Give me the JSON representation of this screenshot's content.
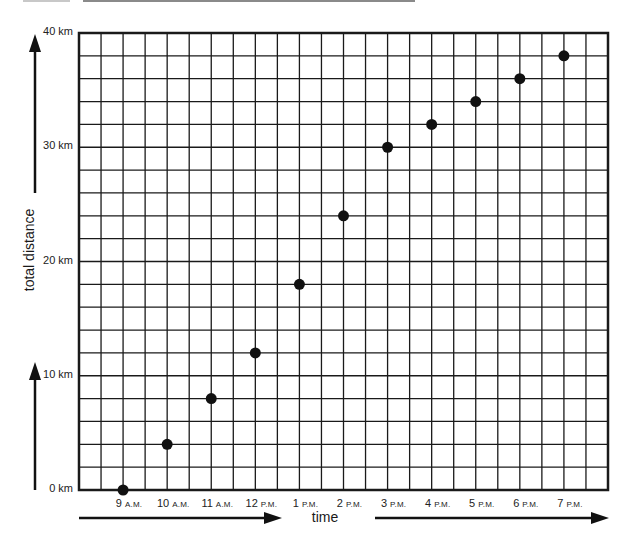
{
  "chart_data": {
    "type": "scatter",
    "title": "",
    "xlabel": "time",
    "ylabel": "total distance",
    "x": [
      "9 A.M.",
      "10 A.M.",
      "11 A.M.",
      "12 P.M.",
      "1 P.M.",
      "2 P.M.",
      "3 P.M.",
      "4 P.M.",
      "5 P.M.",
      "6 P.M.",
      "7 P.M."
    ],
    "series": [
      {
        "name": "total distance (km)",
        "values": [
          0,
          4,
          8,
          12,
          18,
          24,
          30,
          32,
          34,
          36,
          38
        ]
      }
    ],
    "ylim": [
      0,
      40
    ],
    "yticks": [
      0,
      10,
      20,
      30,
      40
    ],
    "ytick_labels": [
      "0 km",
      "10 km",
      "20 km",
      "30 km",
      "40 km"
    ],
    "grid": true,
    "grid_columns": 24,
    "grid_rows": 20,
    "legend": "none"
  },
  "labels": {
    "x_title": "time",
    "y_title": "total distance",
    "y_ticks": [
      {
        "num": "0",
        "unit": "km"
      },
      {
        "num": "10",
        "unit": "km"
      },
      {
        "num": "20",
        "unit": "km"
      },
      {
        "num": "30",
        "unit": "km"
      },
      {
        "num": "40",
        "unit": "km"
      }
    ],
    "x_ticks": [
      {
        "num": "9",
        "suffix": "A.M."
      },
      {
        "num": "10",
        "suffix": "A.M."
      },
      {
        "num": "11",
        "suffix": "A.M."
      },
      {
        "num": "12",
        "suffix": "P.M."
      },
      {
        "num": "1",
        "suffix": "P.M."
      },
      {
        "num": "2",
        "suffix": "P.M."
      },
      {
        "num": "3",
        "suffix": "P.M."
      },
      {
        "num": "4",
        "suffix": "P.M."
      },
      {
        "num": "5",
        "suffix": "P.M."
      },
      {
        "num": "6",
        "suffix": "P.M."
      },
      {
        "num": "7",
        "suffix": "P.M."
      }
    ]
  },
  "colors": {
    "grid": "#1a1a1a",
    "point": "#111111",
    "arrow": "#111111"
  }
}
